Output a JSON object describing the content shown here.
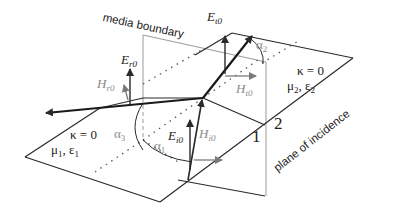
{
  "diagram": {
    "labels": {
      "media_boundary": "media boundary",
      "plane_of_incidence": "plane of incidence",
      "region_1": "1",
      "region_2": "2"
    },
    "medium_1": {
      "kappa": "κ = 0",
      "mu_sym": "μ",
      "mu_sub": "1",
      "eps_sym": "ε",
      "eps_sub": "1",
      "sep": ","
    },
    "medium_2": {
      "kappa": "κ = 0",
      "mu_sym": "μ",
      "mu_sub": "2",
      "eps_sym": "ε",
      "eps_sub": "2",
      "sep": ","
    },
    "vectors": {
      "E_r0": {
        "sym": "E",
        "sub": "r0"
      },
      "H_r0": {
        "sym": "H",
        "sub": "r0"
      },
      "E_t0": {
        "sym": "E",
        "sub": "t0"
      },
      "H_t0": {
        "sym": "H",
        "sub": "t0"
      },
      "E_i0": {
        "sym": "E",
        "sub": "i0"
      },
      "H_i0": {
        "sym": "H",
        "sub": "i0"
      }
    },
    "angles": {
      "alpha_1": {
        "sym": "α",
        "sub": "1"
      },
      "alpha_2": {
        "sym": "α",
        "sub": "2"
      },
      "alpha_3": {
        "sym": "α",
        "sub": "3"
      }
    },
    "colors": {
      "line": "#2a2a2a",
      "boundary": "#9a9a9a",
      "dotted": "#666666",
      "gray_label": "#8a8a8a"
    }
  }
}
